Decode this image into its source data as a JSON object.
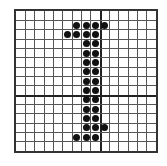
{
  "figure": {
    "glyph": "1",
    "columns": 15,
    "rows": 15,
    "thick_line_col": 9,
    "thick_line_row": 9,
    "colors": {
      "grid": "#555555",
      "border": "#333333",
      "dot": "#111111"
    },
    "dots": [
      [
        1,
        6
      ],
      [
        1,
        7
      ],
      [
        1,
        8
      ],
      [
        1,
        9
      ],
      [
        2,
        5
      ],
      [
        2,
        6
      ],
      [
        2,
        7
      ],
      [
        2,
        8
      ],
      [
        3,
        7
      ],
      [
        3,
        8
      ],
      [
        4,
        7
      ],
      [
        4,
        8
      ],
      [
        5,
        7
      ],
      [
        5,
        8
      ],
      [
        6,
        7
      ],
      [
        6,
        8
      ],
      [
        7,
        7
      ],
      [
        7,
        8
      ],
      [
        8,
        7
      ],
      [
        8,
        8
      ],
      [
        9,
        7
      ],
      [
        9,
        8
      ],
      [
        10,
        7
      ],
      [
        10,
        8
      ],
      [
        11,
        7
      ],
      [
        11,
        8
      ],
      [
        12,
        7
      ],
      [
        12,
        8
      ],
      [
        12,
        9
      ],
      [
        13,
        6
      ],
      [
        13,
        7
      ],
      [
        13,
        8
      ]
    ]
  }
}
